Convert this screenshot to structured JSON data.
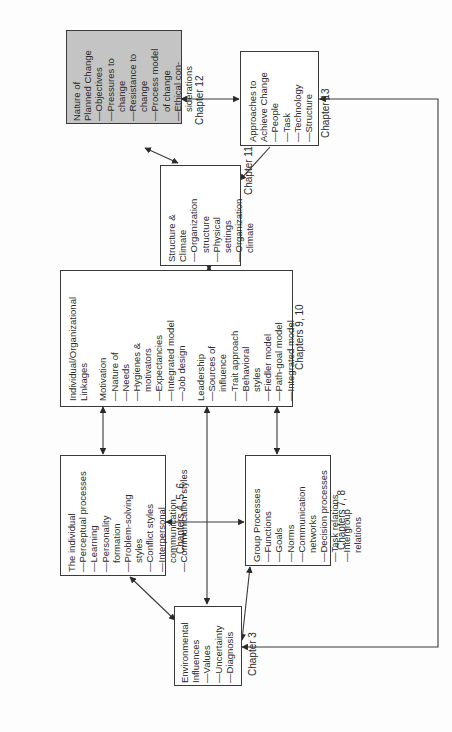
{
  "diagram": {
    "orientation": "rotated-90-ccw",
    "boxes": {
      "nature_of_planned_change": {
        "title": [
          "Nature of",
          "Planned Change"
        ],
        "items": [
          "—Objectives",
          "—Pressures to",
          "change",
          "—Resistance to",
          "change",
          "—Process model",
          "of change",
          "—Ethical con-",
          "siderations"
        ],
        "shaded": true
      },
      "approaches_to_achieve_change": {
        "title": [
          "Approaches to",
          "Achieve Change"
        ],
        "items": [
          "—People",
          "—Task",
          "—Technology",
          "—Structure"
        ]
      },
      "structure_and_climate": {
        "title": [
          "Structure &",
          "Climate"
        ],
        "items": [
          "—Organization",
          "structure",
          "—Physical",
          "settings",
          "—Organization",
          "climate"
        ]
      },
      "individual_organizational_linkages": {
        "title": [
          "Individual/Organizational",
          "Linkages"
        ],
        "motivation_title": "Motivation",
        "motivation_items": [
          "—Nature of",
          "—Needs",
          "—Hygienes &",
          "motivators",
          "—Expectancies",
          "—Integrated model",
          "—Job design"
        ],
        "leadership_title": "Leadership",
        "leadership_items": [
          "—Sources of",
          "influence",
          "—Trait approach",
          "—Behavioral",
          "styles",
          "—Fiedler model",
          "—Path-goal model",
          "—Integrated model"
        ]
      },
      "the_individual": {
        "title": [
          "The individual"
        ],
        "items": [
          "—Perceptual processes",
          "—Learning",
          "—Personality",
          "formation",
          "—Problem-solving",
          "styles",
          "—Conflict styles",
          "—Interpersonal",
          "communication",
          "—Communication styles"
        ]
      },
      "group_processes": {
        "title": [
          "Group Processes"
        ],
        "items": [
          "—Functions",
          "—Goals",
          "—Norms",
          "—Communication",
          "networks",
          "—Decision processes",
          "—Task relations",
          "—Intergroup",
          "relations"
        ]
      },
      "environmental_influences": {
        "title": [
          "Environmental",
          "Influences"
        ],
        "items": [
          "—Values",
          "—Uncertainty",
          "—Diagnosis"
        ]
      }
    },
    "chapter_labels": {
      "ch12": "Chapter 12",
      "ch13": "Chapter 13",
      "ch11": "Chapter 11",
      "ch9_10": "Chapters 9, 10",
      "ch4_5_6": "Chapters 4, 5, 6",
      "ch7_8": "Chapters 7, 8",
      "ch3": "Chapter 3"
    },
    "colors": {
      "line": "#3a3a3a",
      "shaded_fill": "#c4c4c4",
      "box_fill": "#ffffff"
    }
  }
}
